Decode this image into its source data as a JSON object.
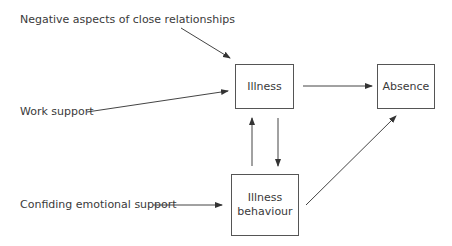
{
  "diagram": {
    "inputs": [
      {
        "id": "negative",
        "label": "Negative aspects of close relationships"
      },
      {
        "id": "work",
        "label": "Work support"
      },
      {
        "id": "confiding",
        "label": "Confiding emotional support"
      }
    ],
    "nodes": [
      {
        "id": "illness",
        "label": "Illness"
      },
      {
        "id": "absence",
        "label": "Absence"
      },
      {
        "id": "behaviour",
        "label_line1": "Illness",
        "label_line2": "behaviour"
      }
    ],
    "edges": [
      {
        "from": "negative",
        "to": "illness"
      },
      {
        "from": "work",
        "to": "illness"
      },
      {
        "from": "confiding",
        "to": "behaviour"
      },
      {
        "from": "illness",
        "to": "absence"
      },
      {
        "from": "behaviour",
        "to": "illness"
      },
      {
        "from": "illness",
        "to": "behaviour"
      },
      {
        "from": "behaviour",
        "to": "absence"
      }
    ]
  }
}
